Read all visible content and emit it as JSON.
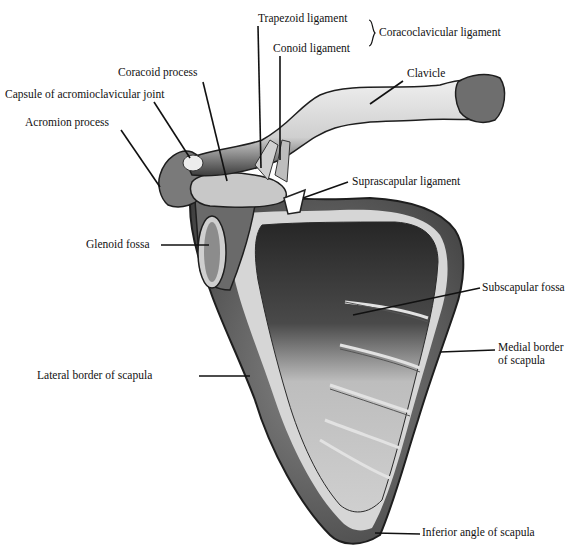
{
  "figure": {
    "labels": {
      "trapezoid": "Trapezoid ligament",
      "coracoclavicular": "Coracoclavicular ligament",
      "conoid": "Conoid ligament",
      "clavicle": "Clavicle",
      "coracoid": "Coracoid process",
      "capsule": "Capsule of acromioclavicular joint",
      "acromion": "Acromion process",
      "suprascapular": "Suprascapular ligament",
      "glenoid": "Glenoid fossa",
      "subscapular": "Subscapular fossa",
      "medial_line1": "Medial border",
      "medial_line2": "of scapula",
      "lateral": "Lateral border of scapula",
      "inferior": "Inferior angle of scapula"
    },
    "colors": {
      "ink": "#111111",
      "bone_light": "#d8d8d8",
      "bone_mid": "#9a9a9a",
      "bone_dark": "#3a3a3a",
      "background": "#ffffff"
    }
  }
}
